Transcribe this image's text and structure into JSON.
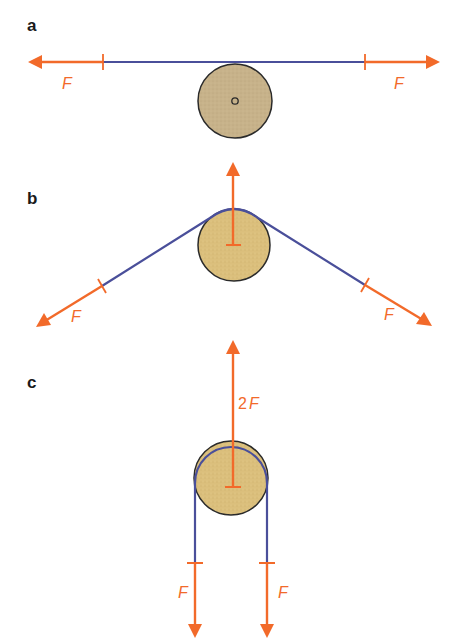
{
  "colors": {
    "force": "#f26a2a",
    "rope": "#4a4f9a",
    "pulley_a_fill": "#c9b48c",
    "pulley_bc_fill": "#dcc07a",
    "pulley_stroke": "#2a2a2a",
    "label": "#1a1a1a"
  },
  "panels": [
    {
      "id": "a",
      "label": "a",
      "forces": [
        {
          "label": "F",
          "direction": "left"
        },
        {
          "label": "F",
          "direction": "right"
        }
      ]
    },
    {
      "id": "b",
      "label": "b",
      "forces": [
        {
          "label": "F",
          "direction": "down-left"
        },
        {
          "label": "F",
          "direction": "down-right"
        },
        {
          "label": "",
          "direction": "up"
        }
      ]
    },
    {
      "id": "c",
      "label": "c",
      "forces": [
        {
          "label": "2",
          "label_suffix": "F",
          "direction": "up"
        },
        {
          "label": "F",
          "direction": "down"
        },
        {
          "label": "F",
          "direction": "down"
        }
      ]
    }
  ]
}
